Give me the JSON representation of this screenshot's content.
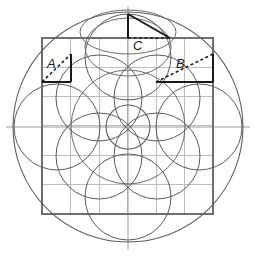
{
  "figure": {
    "type": "compass-and-straightedge diagram",
    "background_color": "#ffffff",
    "stroke_color": "#4a4a4a",
    "grid_color": "#b9b9b9",
    "accent_color": "#1a1a1a",
    "width": 256,
    "height": 256
  },
  "center": {
    "x": 128,
    "y": 127
  },
  "outer_circle": {
    "cx": 128,
    "cy": 127,
    "r": 115,
    "stroke": "#5a5a5a",
    "width": 1
  },
  "square": {
    "x": 42,
    "y": 38,
    "w": 171,
    "h": 176,
    "stroke": "#6a6a6a",
    "width": 1,
    "divisions": 6
  },
  "grid": {
    "color": "#bdbdbd",
    "width": 1,
    "vertical_x": [
      70.5,
      99,
      127.5,
      156,
      184.5
    ],
    "horizontal_y": [
      67.3,
      96.6,
      125.9,
      155.2,
      184.5
    ]
  },
  "axes": {
    "color": "#9a9a9a",
    "vertical": {
      "x": 128,
      "y1": 6,
      "y2": 250
    },
    "horizontal": {
      "y": 127,
      "x1": 6,
      "x2": 250
    }
  },
  "circles": [
    {
      "name": "outer-boundary-circle",
      "cx": 128,
      "cy": 127,
      "r": 115,
      "stroke": "#5a5a5a"
    },
    {
      "name": "left-large-circle",
      "cx": 57,
      "cy": 127,
      "r": 43,
      "stroke": "#5a5a5a"
    },
    {
      "name": "right-large-circle",
      "cx": 199,
      "cy": 127,
      "r": 43,
      "stroke": "#5a5a5a"
    },
    {
      "name": "top-large-circle",
      "cx": 128,
      "cy": 57,
      "r": 43,
      "stroke": "#5a5a5a"
    },
    {
      "name": "bottom-large-circle",
      "cx": 128,
      "cy": 197,
      "r": 43,
      "stroke": "#5a5a5a"
    },
    {
      "name": "upper-left-medium-circle",
      "cx": 99,
      "cy": 98,
      "r": 43,
      "stroke": "#5a5a5a"
    },
    {
      "name": "upper-right-medium-circle",
      "cx": 157,
      "cy": 98,
      "r": 43,
      "stroke": "#5a5a5a"
    },
    {
      "name": "lower-left-medium-circle",
      "cx": 99,
      "cy": 156,
      "r": 43,
      "stroke": "#5a5a5a"
    },
    {
      "name": "lower-right-medium-circle",
      "cx": 157,
      "cy": 156,
      "r": 43,
      "stroke": "#5a5a5a"
    },
    {
      "name": "center-small-circle",
      "cx": 128,
      "cy": 127,
      "r": 22,
      "stroke": "#5a5a5a"
    },
    {
      "name": "top-flat-ellipse",
      "cx": 128,
      "cy": 28,
      "r": 43,
      "stroke": "#6a6a6a"
    },
    {
      "name": "inner-ring-circle",
      "cx": 128,
      "cy": 127,
      "r": 57,
      "stroke": "#6a6a6a"
    }
  ],
  "triangles": [
    {
      "label": "A",
      "name": "triangle-a",
      "label_x": 48,
      "label_y": 66,
      "vertices": {
        "bx": 42,
        "by": 82,
        "cx": 71,
        "cy": 82,
        "ax": 71,
        "ay": 54
      },
      "hypotenuse_style": "dashed",
      "legs_style": "solid",
      "leg_color": "#1a1a1a",
      "hyp_color": "#1a1a1a"
    },
    {
      "label": "B",
      "name": "triangle-b",
      "label_x": 177,
      "label_y": 66,
      "vertices": {
        "bx": 156,
        "by": 82,
        "cx": 213,
        "cy": 82,
        "ax": 213,
        "ay": 54
      },
      "hypotenuse_style": "dashed",
      "legs_style": "solid",
      "leg_color": "#1a1a1a",
      "hyp_color": "#1a1a1a"
    },
    {
      "label": "C",
      "name": "triangle-c",
      "label_x": 136,
      "label_y": 48,
      "vertices": {
        "bx": 128,
        "by": 14,
        "cx": 128,
        "cy": 38,
        "ax": 170,
        "ay": 38
      },
      "hypotenuse_style": "solid",
      "legs_style": "mixed",
      "leg_color": "#1a1a1a",
      "hyp_color": "#1a1a1a"
    }
  ],
  "labels": {
    "a": "A",
    "b": "B",
    "c": "C"
  }
}
